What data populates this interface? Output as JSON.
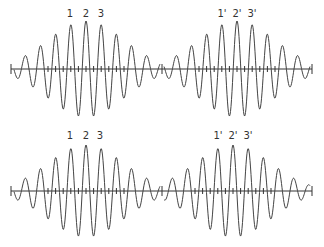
{
  "figure": {
    "stroke_color": "#444444",
    "axis_color": "#333333",
    "rows": [
      {
        "axis_y": 69,
        "axis_x_start": 11,
        "axis_x_end": 312,
        "divider_x": 162,
        "packets": [
          {
            "name": "top-left",
            "center_x": 86,
            "period": 15.2,
            "amplitude": 48,
            "sigma": 38,
            "x_start": 14,
            "x_end": 160,
            "labels": [
              {
                "text": "1",
                "x": 70,
                "y": 9
              },
              {
                "text": "2",
                "x": 86,
                "y": 9
              },
              {
                "text": "3",
                "x": 101,
                "y": 9
              }
            ]
          },
          {
            "name": "top-right",
            "center_x": 237,
            "period": 15.2,
            "amplitude": 48,
            "sigma": 38,
            "x_start": 164,
            "x_end": 310,
            "labels": [
              {
                "text": "1'",
                "x": 222,
                "y": 9
              },
              {
                "text": "2'",
                "x": 237,
                "y": 9
              },
              {
                "text": "3'",
                "x": 252,
                "y": 9
              }
            ]
          }
        ]
      },
      {
        "axis_y": 191,
        "axis_x_start": 11,
        "axis_x_end": 312,
        "divider_x": 162,
        "packets": [
          {
            "name": "bottom-left",
            "center_x": 86,
            "period": 15.2,
            "amplitude": 46,
            "sigma": 38,
            "x_start": 14,
            "x_end": 160,
            "labels": [
              {
                "text": "1",
                "x": 70,
                "y": 131
              },
              {
                "text": "2",
                "x": 86,
                "y": 131
              },
              {
                "text": "3",
                "x": 100,
                "y": 131
              }
            ]
          },
          {
            "name": "bottom-right",
            "center_x": 233,
            "period": 15.2,
            "amplitude": 46,
            "sigma": 38,
            "x_start": 164,
            "x_end": 310,
            "labels": [
              {
                "text": "1'",
                "x": 218,
                "y": 131
              },
              {
                "text": "2'",
                "x": 233,
                "y": 131
              },
              {
                "text": "3'",
                "x": 248,
                "y": 131
              }
            ]
          }
        ]
      }
    ]
  }
}
